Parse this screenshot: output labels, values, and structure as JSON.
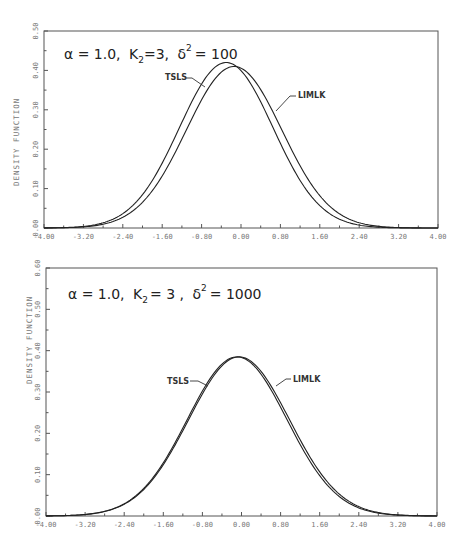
{
  "chart_data": [
    {
      "type": "line",
      "title": "",
      "annotation": {
        "alpha": "α = 1.0,",
        "k2_label": "K",
        "k2_sub": "2",
        "k2_value": "=3,",
        "delta": "δ",
        "delta_sup": "2",
        "delta_value": "= 100"
      },
      "xlabel": "",
      "ylabel": "DENSITY FUNCTION",
      "xlim": [
        -4.0,
        4.0
      ],
      "ylim": [
        0.0,
        0.5
      ],
      "xticks": [
        "-4.00",
        "-3.20",
        "-2.40",
        "-1.60",
        "-0.80",
        "0.00",
        "0.80",
        "1.60",
        "2.40",
        "3.20",
        "4.00"
      ],
      "yticks": [
        "0.00",
        "0.10",
        "0.20",
        "0.30",
        "0.40",
        "0.50"
      ],
      "grid": false,
      "legend_position": "inline-labels",
      "series": [
        {
          "name": "TSLS",
          "peak_x": -0.3,
          "peak_y": 0.42,
          "shape": "approx-normal",
          "sd": 0.95
        },
        {
          "name": "LIMLK",
          "peak_x": -0.14,
          "peak_y": 0.41,
          "shape": "approx-normal",
          "sd": 0.97
        }
      ],
      "x": [
        -4.0,
        -3.2,
        -2.4,
        -1.6,
        -0.8,
        0.0,
        0.8,
        1.6,
        2.4,
        3.2,
        4.0
      ],
      "values_estimated": {
        "TSLS": [
          0.0,
          0.004,
          0.037,
          0.14,
          0.32,
          0.4,
          0.28,
          0.11,
          0.025,
          0.003,
          0.0
        ],
        "LIMLK": [
          0.0,
          0.003,
          0.03,
          0.125,
          0.3,
          0.4,
          0.3,
          0.125,
          0.032,
          0.004,
          0.0
        ]
      }
    },
    {
      "type": "line",
      "title": "",
      "annotation": {
        "alpha": "α = 1.0,",
        "k2_label": "K",
        "k2_sub": "2",
        "k2_value": "= 3 ,",
        "delta": "δ",
        "delta_sup": "2",
        "delta_value": "= 1000"
      },
      "xlabel": "",
      "ylabel": "DENSITY FUNCTION",
      "xlim": [
        -4.0,
        4.0
      ],
      "ylim": [
        0.0,
        0.6
      ],
      "xticks": [
        "-4.00",
        "-3.20",
        "-2.40",
        "-1.60",
        "-0.80",
        "0.00",
        "0.80",
        "1.60",
        "2.40",
        "3.20",
        "4.00"
      ],
      "yticks": [
        "0.00",
        "0.10",
        "0.20",
        "0.30",
        "0.40",
        "0.50",
        "0.60"
      ],
      "grid": false,
      "legend_position": "inline-labels",
      "series": [
        {
          "name": "TSLS",
          "peak_x": -0.09,
          "peak_y": 0.385,
          "shape": "approx-normal",
          "sd": 1.02
        },
        {
          "name": "LIMLK",
          "peak_x": -0.05,
          "peak_y": 0.385,
          "shape": "approx-normal",
          "sd": 1.03
        }
      ],
      "x": [
        -4.0,
        -3.2,
        -2.4,
        -1.6,
        -0.8,
        0.0,
        0.8,
        1.6,
        2.4,
        3.2,
        4.0
      ],
      "values_estimated": {
        "TSLS": [
          0.0,
          0.003,
          0.025,
          0.11,
          0.28,
          0.385,
          0.27,
          0.1,
          0.022,
          0.003,
          0.0
        ],
        "LIMLK": [
          0.0,
          0.003,
          0.024,
          0.105,
          0.275,
          0.385,
          0.275,
          0.105,
          0.024,
          0.003,
          0.0
        ]
      }
    }
  ]
}
